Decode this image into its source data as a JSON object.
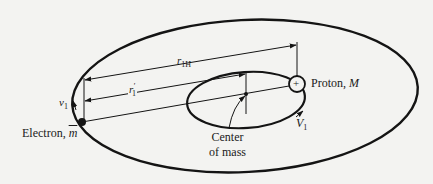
{
  "diagram": {
    "colors": {
      "stroke": "#141414",
      "background": "#f3f3f1"
    },
    "labels": {
      "r1H": {
        "main": "r",
        "sub": "1H"
      },
      "r1prime": {
        "main": "r",
        "sub": "1",
        "prime": "′"
      },
      "v1": {
        "main": "v",
        "sub": "1"
      },
      "V1": {
        "main": "V",
        "sub": "1"
      },
      "proton": {
        "text": "Proton, ",
        "symbol": "M"
      },
      "electron": {
        "text": "Electron, ",
        "symbol": "m"
      },
      "center_of_mass": {
        "line1": "Center",
        "line2": "of mass"
      },
      "proton_sign": "+"
    }
  }
}
